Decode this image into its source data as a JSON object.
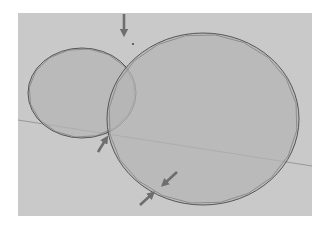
{
  "diagram": {
    "colors": {
      "background": "#ffffff",
      "panel": "#c9c9c9",
      "circle_fill": "#b4b4b4",
      "outline": "#4a4a4a",
      "polygon": "#7a7a7a",
      "horizon": "#8c8c8c",
      "arrow": "#6e6e6e"
    },
    "shapes": [
      {
        "name": "small-circle",
        "polygon_sides": 16
      },
      {
        "name": "large-circle",
        "polygon_sides": 20
      }
    ],
    "arrows": [
      {
        "name": "arrow-top-intersection",
        "direction": "down"
      },
      {
        "name": "arrow-bottom-intersection",
        "direction": "up-right"
      },
      {
        "name": "arrow-lower-edge-outer",
        "direction": "down-left"
      },
      {
        "name": "arrow-lower-edge-inner",
        "direction": "up-right"
      }
    ]
  }
}
